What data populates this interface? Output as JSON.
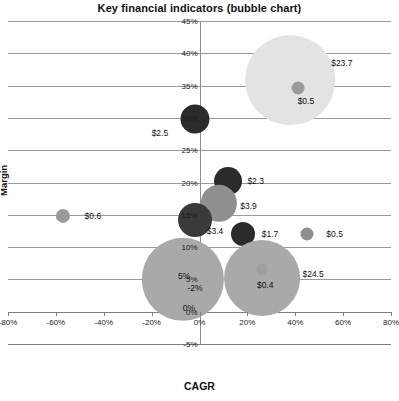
{
  "chart_data": {
    "type": "scatter",
    "title": "Key financial indicators (bubble chart)",
    "xlabel": "CAGR",
    "ylabel": "Margin",
    "xlim": [
      -80,
      80
    ],
    "ylim": [
      -5,
      45
    ],
    "grid": true,
    "legend": "none",
    "xticks": [
      "-80%",
      "-60%",
      "-40%",
      "-20%",
      "0%",
      "20%",
      "40%",
      "60%",
      "80%"
    ],
    "xtick_values": [
      -80,
      -60,
      -40,
      -20,
      0,
      20,
      40,
      60,
      80
    ],
    "yticks": [
      "45%",
      "40%",
      "35%",
      "30%",
      "25%",
      "20%",
      "15%",
      "10%",
      "5%",
      "0%",
      "-5%"
    ],
    "ytick_values": [
      45,
      40,
      35,
      30,
      25,
      20,
      15,
      10,
      5,
      0,
      -5
    ],
    "points": [
      {
        "label": "$23.7",
        "x": 38,
        "y": 35.8,
        "size": 23.7,
        "color": "#e3e3e3"
      },
      {
        "label": "$0.5",
        "x": 41,
        "y": 34.6,
        "size": 0.5,
        "color": "#9a9a9a"
      },
      {
        "label": "$2.5",
        "x": -2,
        "y": 29.8,
        "size": 2.5,
        "color": "#2b2b2b"
      },
      {
        "label": "$2.3",
        "x": 12,
        "y": 20.2,
        "size": 2.3,
        "color": "#2b2b2b"
      },
      {
        "label": "$3.9",
        "x": 8,
        "y": 16.8,
        "size": 3.9,
        "color": "#8f8f8f"
      },
      {
        "label": "$0.6",
        "x": -57,
        "y": 14.8,
        "size": 0.6,
        "color": "#9a9a9a"
      },
      {
        "label": "$3.4",
        "x": -2,
        "y": 14.2,
        "size": 3.4,
        "color": "#3a3a3a"
      },
      {
        "label": "$1.7",
        "x": 18,
        "y": 12.0,
        "size": 1.7,
        "color": "#2b2b2b"
      },
      {
        "label": "$0.5",
        "x": 45,
        "y": 12.0,
        "size": 0.5,
        "color": "#8f8f8f"
      },
      {
        "label": "-2%",
        "x": -7,
        "y": 5.0,
        "size": 20.0,
        "color": "#a9a9a9"
      },
      {
        "label": "$24.5",
        "x": 26,
        "y": 5.2,
        "size": 17.0,
        "color": "#a9a9a9"
      },
      {
        "label": "$0.4",
        "x": 26,
        "y": 6.6,
        "size": 0.4,
        "color": "#9f9f9f"
      }
    ],
    "annotations": [
      {
        "text": "$23.7",
        "x": 55,
        "y": 38.5
      },
      {
        "text": "$0.5",
        "x": 41,
        "y": 32.6
      },
      {
        "text": "$2.5",
        "x": -20,
        "y": 27.6
      },
      {
        "text": "$2.3",
        "x": 20,
        "y": 20.2
      },
      {
        "text": "$3.9",
        "x": 17,
        "y": 16.4
      },
      {
        "text": "$0.6",
        "x": -48,
        "y": 14.8
      },
      {
        "text": "$3.4",
        "x": 3,
        "y": 12.5
      },
      {
        "text": "$1.7",
        "x": 26,
        "y": 12.0
      },
      {
        "text": "$0.5",
        "x": 53,
        "y": 12.0
      },
      {
        "text": "5%",
        "x": -9,
        "y": 5.6
      },
      {
        "text": "-2%",
        "x": -5,
        "y": 3.6
      },
      {
        "text": "0%",
        "x": -7,
        "y": 0.5
      },
      {
        "text": "$24.5",
        "x": 43,
        "y": 5.8
      },
      {
        "text": "$0.4",
        "x": 24,
        "y": 4.2
      }
    ]
  }
}
